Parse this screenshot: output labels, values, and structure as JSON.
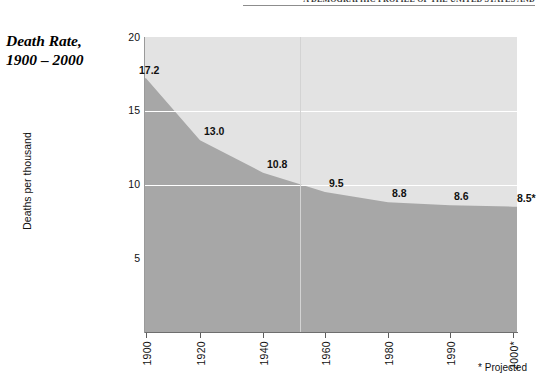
{
  "page_header": {
    "text": "A Demographic Profile of the United States and"
  },
  "figure": {
    "title_line1": "Death Rate,",
    "title_line2": "1900 – 2000",
    "footnote": "* Projected",
    "colors": {
      "area_fill": "#a7a7a7",
      "plot_background": "#e3e3e3",
      "gridline": "#ffffff",
      "axis": "#6e6e6e",
      "text": "#111111"
    }
  },
  "chart_data": {
    "type": "area",
    "title": "Death Rate, 1900 – 2000",
    "xlabel": "",
    "ylabel": "Deaths per thousand",
    "x": [
      1900,
      1920,
      1940,
      1960,
      1980,
      1990,
      2000
    ],
    "tick_labels": [
      "1900",
      "1920",
      "1940",
      "1960",
      "1980",
      "1990",
      "2000*"
    ],
    "values": [
      17.2,
      13.0,
      10.8,
      9.5,
      8.8,
      8.6,
      8.5
    ],
    "point_labels": [
      "17.2",
      "13.0",
      "10.8",
      "9.5",
      "8.8",
      "8.6",
      "8.5*"
    ],
    "ylim": [
      0,
      20
    ],
    "ytick_labels": [
      "5",
      "10",
      "15",
      "20"
    ],
    "yticks": [
      5,
      10,
      15,
      20
    ],
    "grid": "horizontal-white",
    "legend": "none",
    "annotations": [
      "* Projected"
    ]
  }
}
